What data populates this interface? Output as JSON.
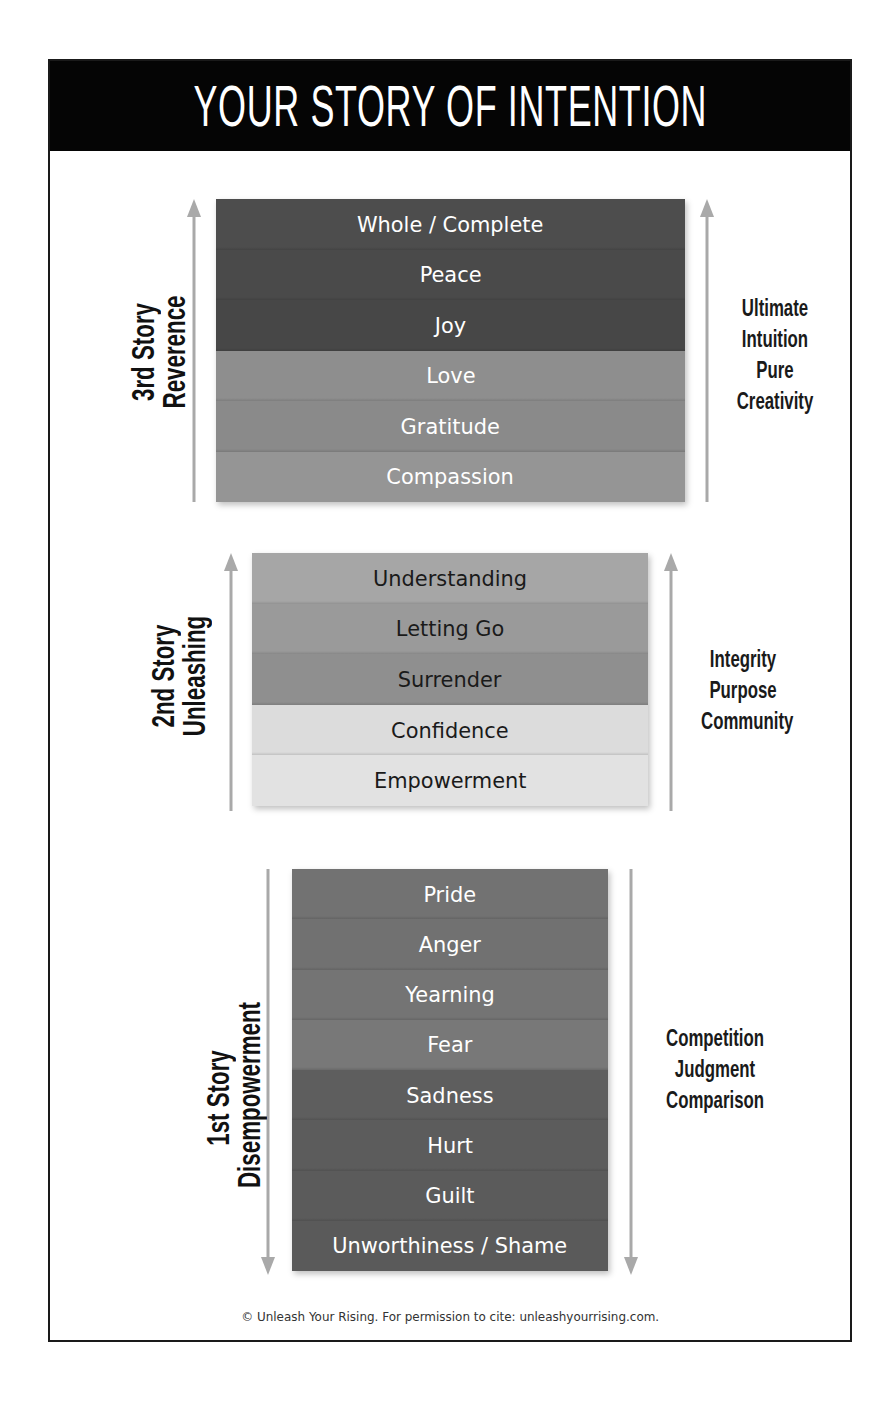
{
  "title": "YOUR STORY OF INTENTION",
  "stories": [
    {
      "id": "third",
      "label_line1": "3rd Story",
      "label_line2": "Reverence",
      "direction": "up",
      "qualities": [
        "Ultimate",
        "Intuition",
        "Pure",
        "Creativity"
      ],
      "levels": [
        {
          "name": "Whole / Complete",
          "color": "#4d4d4d",
          "text_color": "#ffffff"
        },
        {
          "name": "Peace",
          "color": "#4a4a4a",
          "text_color": "#ffffff"
        },
        {
          "name": "Joy",
          "color": "#474747",
          "text_color": "#ffffff"
        },
        {
          "name": "Love",
          "color": "#8e8e8e",
          "text_color": "#ffffff"
        },
        {
          "name": "Gratitude",
          "color": "#8a8a8a",
          "text_color": "#ffffff"
        },
        {
          "name": "Compassion",
          "color": "#959595",
          "text_color": "#ffffff"
        }
      ]
    },
    {
      "id": "second",
      "label_line1": "2nd Story",
      "label_line2": "Unleashing",
      "direction": "up",
      "qualities": [
        "Integrity",
        "Purpose",
        "Community"
      ],
      "levels": [
        {
          "name": "Understanding",
          "color": "#a6a6a6",
          "text_color": "#1a1a1a"
        },
        {
          "name": "Letting Go",
          "color": "#9a9a9a",
          "text_color": "#1a1a1a"
        },
        {
          "name": "Surrender",
          "color": "#8f8f8f",
          "text_color": "#1a1a1a"
        },
        {
          "name": "Confidence",
          "color": "#dcdcdc",
          "text_color": "#1a1a1a"
        },
        {
          "name": "Empowerment",
          "color": "#e2e2e2",
          "text_color": "#1a1a1a"
        }
      ]
    },
    {
      "id": "first",
      "label_line1": "1st Story",
      "label_line2": "Disempowerment",
      "direction": "down",
      "qualities": [
        "Competition",
        "Judgment",
        "Comparison"
      ],
      "levels": [
        {
          "name": "Pride",
          "color": "#727272",
          "text_color": "#ffffff"
        },
        {
          "name": "Anger",
          "color": "#717171",
          "text_color": "#ffffff"
        },
        {
          "name": "Yearning",
          "color": "#747474",
          "text_color": "#ffffff"
        },
        {
          "name": "Fear",
          "color": "#787878",
          "text_color": "#ffffff"
        },
        {
          "name": "Sadness",
          "color": "#5e5e5e",
          "text_color": "#ffffff"
        },
        {
          "name": "Hurt",
          "color": "#5c5c5c",
          "text_color": "#ffffff"
        },
        {
          "name": "Guilt",
          "color": "#5b5b5b",
          "text_color": "#ffffff"
        },
        {
          "name": "Unworthiness / Shame",
          "color": "#5a5a5a",
          "text_color": "#ffffff"
        }
      ]
    }
  ],
  "arrow_color": "#a9a9a9",
  "footer": "© Unleash Your Rising. For permission to cite: unleashyourrising.com."
}
